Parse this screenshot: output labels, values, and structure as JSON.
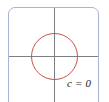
{
  "figure": {
    "type": "level-curve-diagram",
    "background_color": "#ffffff",
    "frame": {
      "border_color": "#a8b2d2",
      "corner_radius_px": 7
    },
    "axes": {
      "color": "#7e7e82",
      "origin_x_px": 54,
      "origin_y_px": 56,
      "vertical_label": "",
      "horizontal_label": ""
    },
    "curve": {
      "shape": "circle",
      "color": "#c0564a",
      "center_x_px": 54,
      "center_y_px": 56,
      "radius_px": 23.5,
      "label": "c = 0"
    }
  },
  "chart_data": {
    "type": "scatter",
    "title": "",
    "xlabel": "",
    "ylabel": "",
    "grid": false,
    "legend": "none",
    "annotations": [
      "c = 0"
    ],
    "series": [
      {
        "name": "c = 0",
        "shape": "circle",
        "center": [
          0,
          0
        ],
        "radius": 1,
        "color": "#c0564a"
      }
    ],
    "xlim": [
      -1.95,
      1.95
    ],
    "ylim": [
      -2.1,
      2.0
    ]
  }
}
